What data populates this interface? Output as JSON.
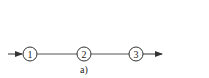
{
  "diagram": {
    "nodes": [
      {
        "id": "1",
        "label": "1"
      },
      {
        "id": "2",
        "label": "2"
      },
      {
        "id": "3",
        "label": "3"
      }
    ],
    "edges": [
      {
        "from": "input",
        "to": "1",
        "arrow": true
      },
      {
        "from": "1",
        "to": "2",
        "arrow": false
      },
      {
        "from": "2",
        "to": "3",
        "arrow": false
      },
      {
        "from": "3",
        "to": "output",
        "arrow": true
      }
    ],
    "caption": "a)",
    "stroke_color": "#333333"
  }
}
